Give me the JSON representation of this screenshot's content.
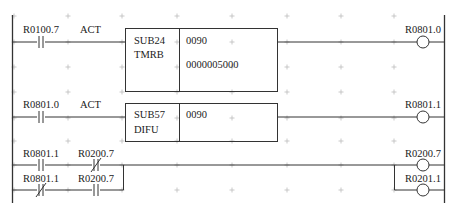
{
  "diagram": {
    "type": "ladder-logic",
    "rungs": [
      {
        "id": 1,
        "contacts": [
          {
            "address": "R0100.7",
            "type": "normally-open",
            "label": "ACT"
          }
        ],
        "function_block": {
          "code": "SUB24",
          "name": "TMRB",
          "params": [
            "0090",
            "0000005000"
          ]
        },
        "coil": {
          "address": "R0801.0"
        }
      },
      {
        "id": 2,
        "contacts": [
          {
            "address": "R0801.0",
            "type": "normally-open",
            "label": "ACT"
          }
        ],
        "function_block": {
          "code": "SUB57",
          "name": "DIFU",
          "params": [
            "0090"
          ]
        },
        "coil": {
          "address": "R0801.1"
        }
      },
      {
        "id": 3,
        "branches": [
          {
            "contacts": [
              {
                "address": "R0801.1",
                "type": "normally-open"
              },
              {
                "address": "R0200.7",
                "type": "normally-closed"
              }
            ]
          },
          {
            "contacts": [
              {
                "address": "R0801.1",
                "type": "normally-closed"
              },
              {
                "address": "R0200.7",
                "type": "normally-open"
              }
            ]
          }
        ],
        "coils": [
          {
            "address": "R0200.7"
          },
          {
            "address": "R0201.1"
          }
        ]
      }
    ]
  },
  "labels": {
    "r1_contact": "R0100.7",
    "r1_act": "ACT",
    "r1_block_code": "SUB24",
    "r1_block_name": "TMRB",
    "r1_param1": "0090",
    "r1_param2": "0000005000",
    "r1_coil": "R0801.0",
    "r2_contact": "R0801.0",
    "r2_act": "ACT",
    "r2_block_code": "SUB57",
    "r2_block_name": "DIFU",
    "r2_param1": "0090",
    "r2_coil": "R0801.1",
    "r3a_contact1": "R0801.1",
    "r3a_contact2": "R0200.7",
    "r3b_contact1": "R0801.1",
    "r3b_contact2": "R0200.7",
    "r3_coil1": "R0200.7",
    "r3_coil2": "R0201.1"
  },
  "colors": {
    "line": "#333333",
    "grid": "#bbbbbb",
    "background": "#ffffff"
  }
}
